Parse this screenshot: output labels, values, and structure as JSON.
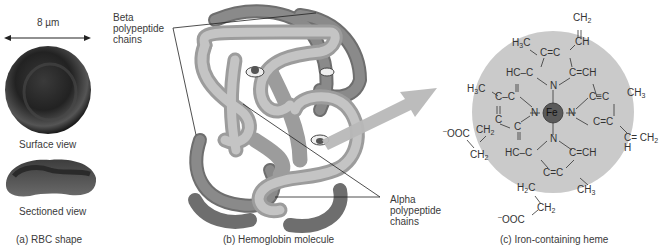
{
  "panel_a": {
    "scale_label": "8 µm",
    "surface_view_label": "Surface view",
    "sectioned_view_label": "Sectioned view",
    "caption": "(a) RBC shape"
  },
  "panel_b": {
    "beta_label_line1": "Beta",
    "beta_label_line2": "polypeptide",
    "beta_label_line3": "chains",
    "alpha_label_line1": "Alpha",
    "alpha_label_line2": "polypeptide",
    "alpha_label_line3": "chains",
    "caption": "(b) Hemoglobin molecule"
  },
  "panel_c": {
    "caption": "(c) Iron-containing heme",
    "center_atom": "Fe",
    "nitrogen": "N",
    "colors": {
      "background_disc": "#c8c8c8",
      "iron": "#5a5a5a"
    }
  }
}
